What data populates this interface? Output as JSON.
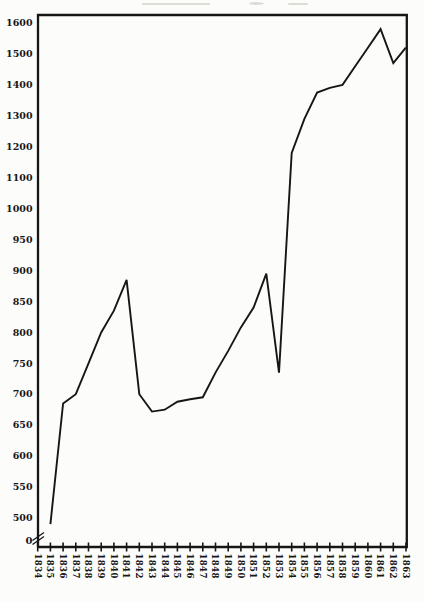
{
  "page": {
    "background": "#fcfcfa",
    "ink_color": "#161616"
  },
  "chart_data": {
    "type": "line",
    "title": "",
    "xlabel": "",
    "ylabel": "",
    "grid": false,
    "legend": false,
    "line_color": "#161616",
    "axis_color": "#161616",
    "x_axis": {
      "tick_labels": [
        "1834",
        "1835",
        "1836",
        "1837",
        "1838",
        "1839",
        "1840",
        "1841",
        "1842",
        "1843",
        "1844",
        "1845",
        "1846",
        "1847",
        "1848",
        "1849",
        "1850",
        "1851",
        "1852",
        "1853",
        "1854",
        "1855",
        "1856",
        "1857",
        "1858",
        "1859",
        "1860",
        "1861",
        "1862",
        "1863"
      ]
    },
    "y_axis": {
      "tick_labels": [
        1600,
        1500,
        1400,
        1300,
        1200,
        1100,
        1000,
        950,
        900,
        850,
        800,
        750,
        700,
        650,
        600,
        550,
        500
      ],
      "bottom_label": "0",
      "has_break": true,
      "scale_note": "50-unit steps below 1000, 100-unit steps above 1000, equal spacing per step; axis break between 0 and 500",
      "ylim_drawn": [
        500,
        1600
      ]
    },
    "series": [
      {
        "name": "main-line",
        "years": [
          1835,
          1836,
          1837,
          1838,
          1839,
          1840,
          1841,
          1842,
          1843,
          1844,
          1845,
          1846,
          1847,
          1848,
          1849,
          1850,
          1851,
          1852,
          1853,
          1854,
          1855,
          1856,
          1857,
          1858,
          1859,
          1860,
          1861,
          1862,
          1863
        ],
        "values": [
          490,
          685,
          700,
          750,
          800,
          835,
          885,
          700,
          672,
          675,
          688,
          692,
          695,
          735,
          770,
          808,
          840,
          895,
          735,
          1180,
          1290,
          1375,
          1390,
          1400,
          1460,
          1520,
          1580,
          1470,
          1520
        ]
      }
    ]
  }
}
